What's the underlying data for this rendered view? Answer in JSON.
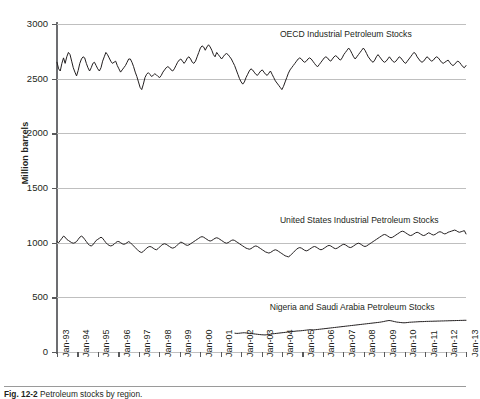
{
  "chart_data": {
    "type": "line",
    "title": "",
    "xlabel": "",
    "ylabel": "Million barrels",
    "ylim": [
      0,
      3000
    ],
    "yticks": [
      0,
      500,
      1000,
      1500,
      2000,
      2500,
      3000
    ],
    "ytick_labels": [
      "0",
      "500",
      "1000",
      "1500",
      "2000",
      "2500",
      "3000"
    ],
    "grid": "horizontal",
    "legend_position": "inline-annotation",
    "xtick_labels": [
      "Jan-93",
      "Jan-94",
      "Jan-95",
      "Jan-96",
      "Jan-97",
      "Jan-98",
      "Jan-99",
      "Jan-00",
      "Jan-01",
      "Jan-02",
      "Jan-03",
      "Jan-04",
      "Jan-05",
      "Jan-06",
      "Jan-07",
      "Jan-08",
      "Jan-09",
      "Jan-10",
      "Jan-11",
      "Jan-12",
      "Jan-13"
    ],
    "x_start": "Jan-93",
    "x_end": "Jan-13",
    "line_color": "#231f20",
    "grid_color": "#bfbfbf",
    "axis_color": "#58595b",
    "series": [
      {
        "name": "OECD Industrial  Petroleum Stocks",
        "label_x_frac": 0.545,
        "label_y_value": 2900,
        "values": [
          2650,
          2590,
          2570,
          2640,
          2690,
          2640,
          2700,
          2740,
          2720,
          2660,
          2600,
          2560,
          2525,
          2575,
          2640,
          2680,
          2700,
          2690,
          2640,
          2600,
          2570,
          2600,
          2640,
          2650,
          2620,
          2590,
          2570,
          2600,
          2660,
          2700,
          2740,
          2720,
          2690,
          2660,
          2640,
          2650,
          2660,
          2620,
          2590,
          2560,
          2580,
          2600,
          2620,
          2650,
          2680,
          2680,
          2650,
          2610,
          2560,
          2520,
          2470,
          2420,
          2400,
          2450,
          2510,
          2540,
          2555,
          2540,
          2520,
          2530,
          2545,
          2535,
          2520,
          2510,
          2530,
          2560,
          2580,
          2600,
          2610,
          2600,
          2580,
          2570,
          2590,
          2620,
          2650,
          2670,
          2680,
          2660,
          2640,
          2660,
          2690,
          2700,
          2680,
          2650,
          2640,
          2660,
          2700,
          2740,
          2780,
          2800,
          2790,
          2760,
          2790,
          2810,
          2790,
          2760,
          2720,
          2700,
          2740,
          2720,
          2700,
          2680,
          2700,
          2720,
          2730,
          2720,
          2700,
          2680,
          2650,
          2620,
          2580,
          2540,
          2500,
          2470,
          2450,
          2470,
          2510,
          2540,
          2570,
          2590,
          2580,
          2560,
          2540,
          2530,
          2550,
          2570,
          2580,
          2560,
          2540,
          2530,
          2550,
          2570,
          2540,
          2510,
          2480,
          2460,
          2440,
          2420,
          2400,
          2430,
          2470,
          2510,
          2550,
          2580,
          2600,
          2620,
          2640,
          2660,
          2680,
          2690,
          2680,
          2660,
          2650,
          2660,
          2680,
          2690,
          2680,
          2660,
          2640,
          2620,
          2610,
          2630,
          2650,
          2670,
          2690,
          2700,
          2690,
          2670,
          2660,
          2680,
          2700,
          2710,
          2700,
          2680,
          2670,
          2690,
          2720,
          2740,
          2760,
          2780,
          2760,
          2730,
          2700,
          2680,
          2700,
          2720,
          2740,
          2760,
          2780,
          2760,
          2730,
          2700,
          2680,
          2660,
          2650,
          2670,
          2700,
          2720,
          2700,
          2680,
          2660,
          2650,
          2660,
          2680,
          2700,
          2680,
          2660,
          2650,
          2660,
          2680,
          2700,
          2690,
          2670,
          2650,
          2640,
          2660,
          2680,
          2700,
          2720,
          2740,
          2730,
          2700,
          2680,
          2660,
          2650,
          2660,
          2680,
          2700,
          2690,
          2670,
          2660,
          2670,
          2690,
          2700,
          2690,
          2670,
          2650,
          2640,
          2650,
          2660,
          2670,
          2650,
          2630,
          2620,
          2630,
          2650,
          2660,
          2650,
          2630,
          2610,
          2600,
          2620
        ]
      },
      {
        "name": "United States Industrial Petroleum Stocks",
        "label_x_frac": 0.545,
        "label_y_value": 1200,
        "values": [
          1010,
          1000,
          1020,
          1040,
          1060,
          1050,
          1030,
          1020,
          1010,
          1000,
          995,
          1000,
          1010,
          1030,
          1050,
          1060,
          1050,
          1030,
          1010,
          990,
          975,
          970,
          980,
          1000,
          1020,
          1030,
          1040,
          1050,
          1040,
          1020,
          1000,
          985,
          975,
          970,
          975,
          985,
          1000,
          1010,
          1010,
          1000,
          990,
          985,
          990,
          1000,
          1010,
          1000,
          985,
          970,
          955,
          940,
          925,
          915,
          910,
          920,
          935,
          950,
          960,
          965,
          960,
          950,
          940,
          935,
          945,
          960,
          975,
          985,
          990,
          985,
          975,
          965,
          955,
          950,
          955,
          965,
          980,
          995,
          1005,
          1000,
          990,
          980,
          975,
          980,
          990,
          1000,
          1010,
          1020,
          1030,
          1040,
          1050,
          1055,
          1050,
          1040,
          1030,
          1020,
          1015,
          1020,
          1030,
          1040,
          1045,
          1040,
          1030,
          1020,
          1010,
          1000,
          995,
          1000,
          1010,
          1020,
          1025,
          1020,
          1010,
          1000,
          990,
          980,
          970,
          960,
          950,
          945,
          940,
          945,
          955,
          965,
          970,
          965,
          955,
          945,
          935,
          925,
          915,
          910,
          905,
          910,
          920,
          930,
          935,
          930,
          920,
          910,
          900,
          890,
          880,
          875,
          870,
          880,
          895,
          910,
          925,
          940,
          950,
          955,
          950,
          940,
          930,
          925,
          930,
          940,
          950,
          960,
          965,
          960,
          950,
          940,
          935,
          940,
          950,
          960,
          970,
          975,
          970,
          960,
          950,
          945,
          950,
          960,
          970,
          980,
          985,
          980,
          970,
          960,
          955,
          960,
          970,
          980,
          990,
          995,
          990,
          980,
          970,
          965,
          970,
          980,
          990,
          1000,
          1010,
          1020,
          1030,
          1040,
          1050,
          1060,
          1070,
          1075,
          1070,
          1060,
          1050,
          1045,
          1050,
          1060,
          1070,
          1080,
          1090,
          1100,
          1105,
          1100,
          1090,
          1080,
          1070,
          1065,
          1070,
          1080,
          1090,
          1095,
          1090,
          1080,
          1070,
          1065,
          1070,
          1080,
          1090,
          1085,
          1075,
          1070,
          1075,
          1085,
          1095,
          1100,
          1095,
          1085,
          1080,
          1085,
          1095,
          1100,
          1105,
          1110,
          1115,
          1110,
          1100,
          1095,
          1100,
          1105,
          1110,
          1080
        ]
      },
      {
        "name": "Nigeria and Saudi Arabia Petroleum Stocks",
        "label_x_frac": 0.52,
        "label_y_value": 400,
        "start_x_frac": 0.435,
        "values": [
          172,
          170,
          171,
          173,
          175,
          176,
          174,
          172,
          170,
          168,
          166,
          164,
          162,
          160,
          158,
          157,
          156,
          158,
          160,
          163,
          166,
          168,
          170,
          172,
          174,
          176,
          178,
          180,
          182,
          184,
          186,
          188,
          190,
          192,
          193,
          194,
          196,
          198,
          200,
          202,
          204,
          203,
          202,
          204,
          206,
          208,
          210,
          212,
          214,
          216,
          218,
          220,
          222,
          224,
          226,
          228,
          230,
          232,
          234,
          236,
          238,
          240,
          242,
          244,
          246,
          248,
          250,
          252,
          254,
          256,
          258,
          260,
          262,
          264,
          266,
          268,
          270,
          272,
          275,
          278,
          282,
          285,
          288,
          286,
          282,
          278,
          274,
          272,
          270,
          268,
          267,
          268,
          270,
          272,
          273,
          274,
          275,
          276,
          277,
          278,
          278,
          279,
          280,
          280,
          281,
          281,
          282,
          282,
          283,
          283,
          284,
          284,
          285,
          285,
          286,
          286,
          287,
          287,
          288,
          288,
          289,
          289,
          290,
          290
        ]
      }
    ]
  },
  "caption": {
    "figure_number": "Fig. 12-2",
    "text": "Petroleum stocks by region."
  }
}
